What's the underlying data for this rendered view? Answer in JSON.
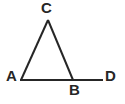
{
  "figure": {
    "background_color": "#ffffff",
    "stroke_color": "#262626",
    "stroke_width": 2,
    "width": 125,
    "height": 104,
    "labels": {
      "A": "A",
      "B": "B",
      "C": "C",
      "D": "D"
    },
    "points": {
      "A": {
        "x": 21,
        "y": 80
      },
      "B": {
        "x": 73,
        "y": 80
      },
      "C": {
        "x": 48,
        "y": 20
      },
      "D": {
        "x": 103,
        "y": 80
      }
    },
    "segments": [
      {
        "name": "segment-AC",
        "from": "A",
        "to": "C"
      },
      {
        "name": "segment-CB",
        "from": "C",
        "to": "B"
      },
      {
        "name": "segment-AD",
        "from": "A",
        "to": "D"
      }
    ]
  }
}
